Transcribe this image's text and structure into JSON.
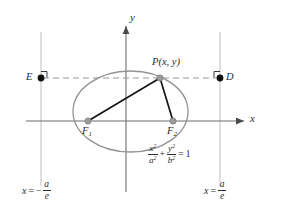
{
  "figure": {
    "colors": {
      "axis": "#6e6e6e",
      "curve": "#8c8c8c",
      "directrix": "#b8b8b8",
      "focal_segment": "#1a1a1a",
      "dashed_line": "#9a9a9a",
      "point_marker": "#8f8f8f",
      "solid_marker": "#141414",
      "text": "#2b2b2b",
      "background": "#ffffff"
    },
    "axes": {
      "x_label": "x",
      "y_label": "y",
      "origin": {
        "x": 126,
        "y": 121
      }
    },
    "curve": {
      "type": "ellipse",
      "center": {
        "x": 130.5,
        "y": 111.5
      },
      "semi_major_a_px": 57.5,
      "semi_minor_b_px": 40.5,
      "equation": {
        "x_var": "x",
        "y_var": "y",
        "x_power": "2",
        "y_power": "2",
        "a_var": "a",
        "a_power": "2",
        "b_var": "b",
        "b_power": "2",
        "operator": "+",
        "equals": "=",
        "rhs": "1"
      }
    },
    "points": [
      {
        "name": "point-p",
        "label_base": "P",
        "label_args": "(x, y)",
        "x": 160,
        "y": 78,
        "marker": "hollow-gray"
      },
      {
        "name": "focus-1",
        "label_base": "F",
        "label_sub": "1",
        "x": 88,
        "y": 121,
        "marker": "hollow-gray"
      },
      {
        "name": "focus-2",
        "label_base": "F",
        "label_sub": "2",
        "x": 173,
        "y": 121,
        "marker": "hollow-gray"
      },
      {
        "name": "point-e",
        "label_base": "E",
        "x": 41,
        "y": 78,
        "marker": "solid-black"
      },
      {
        "name": "point-d",
        "label_base": "D",
        "x": 220,
        "y": 78,
        "marker": "solid-black"
      }
    ],
    "segments": [
      {
        "name": "focal-radius-f1-p",
        "from": "F1",
        "to": "P"
      },
      {
        "name": "focal-radius-f2-p",
        "from": "F2",
        "to": "P"
      }
    ],
    "dashed_line": {
      "name": "directrix-chord-e-to-d",
      "from_x": 41,
      "to_x": 220,
      "y": 78
    },
    "directrices": [
      {
        "name": "directrix-left",
        "x": 41,
        "equation": {
          "lhs": "x",
          "equals": "=",
          "sign": "−",
          "num": "a",
          "den": "e"
        }
      },
      {
        "name": "directrix-right",
        "x": 220,
        "equation": {
          "lhs": "x",
          "equals": "=",
          "sign": "",
          "num": "a",
          "den": "e"
        }
      }
    ],
    "right_angle_marks": [
      {
        "name": "right-angle-mark-e",
        "x": 41,
        "y": 78
      },
      {
        "name": "right-angle-mark-d",
        "x": 220,
        "y": 78
      }
    ]
  }
}
